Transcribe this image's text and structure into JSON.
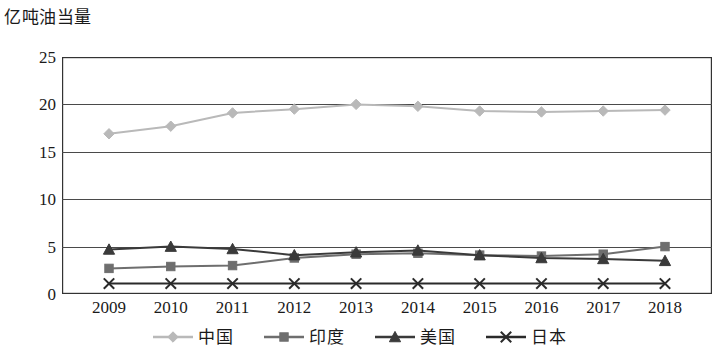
{
  "chart_data": {
    "type": "line",
    "title": "",
    "ylabel": "亿吨油当量",
    "xlabel": "",
    "ylim": [
      0,
      25
    ],
    "yticks": [
      0,
      5,
      10,
      15,
      20,
      25
    ],
    "grid": true,
    "legend_position": "bottom",
    "categories": [
      "2009",
      "2010",
      "2011",
      "2012",
      "2013",
      "2014",
      "2015",
      "2016",
      "2017",
      "2018"
    ],
    "series": [
      {
        "name": "中国",
        "marker": "diamond",
        "color": "#b9b9b9",
        "values": [
          16.9,
          17.7,
          19.1,
          19.5,
          20.0,
          19.8,
          19.3,
          19.2,
          19.3,
          19.4
        ]
      },
      {
        "name": "印度",
        "marker": "square",
        "color": "#6e6e6e",
        "values": [
          2.7,
          2.9,
          3.0,
          3.8,
          4.2,
          4.3,
          4.1,
          4.0,
          4.2,
          5.0
        ]
      },
      {
        "name": "美国",
        "marker": "triangle",
        "color": "#3a3a3a",
        "values": [
          4.7,
          5.0,
          4.75,
          4.1,
          4.4,
          4.6,
          4.1,
          3.8,
          3.7,
          3.5
        ]
      },
      {
        "name": "日本",
        "marker": "cross",
        "color": "#2a2a2a",
        "values": [
          1.1,
          1.1,
          1.1,
          1.1,
          1.1,
          1.1,
          1.1,
          1.1,
          1.1,
          1.1
        ]
      }
    ]
  },
  "axis": {
    "y_unit_label": "亿吨油当量",
    "y_tick_labels": [
      "0",
      "5",
      "10",
      "15",
      "20",
      "25"
    ],
    "x_tick_labels": [
      "2009",
      "2010",
      "2011",
      "2012",
      "2013",
      "2014",
      "2015",
      "2016",
      "2017",
      "2018"
    ]
  },
  "legend": {
    "items": [
      {
        "label": "中国",
        "marker": "diamond-marker",
        "color": "#b9b9b9"
      },
      {
        "label": "印度",
        "marker": "square-marker",
        "color": "#6e6e6e"
      },
      {
        "label": "美国",
        "marker": "triangle-marker",
        "color": "#3a3a3a"
      },
      {
        "label": "日本",
        "marker": "cross-marker",
        "color": "#2a2a2a"
      }
    ]
  },
  "style": {
    "grid_color": "#4a4a4a",
    "axis_color": "#333333",
    "background": "#ffffff"
  }
}
